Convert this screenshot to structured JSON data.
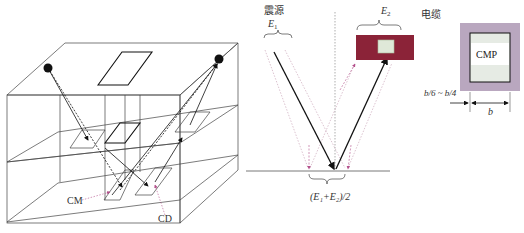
{
  "figure": {
    "panel_3d": {
      "labels": {
        "cm": "CM",
        "cd": "CD"
      }
    },
    "panel_reflection": {
      "source_label": "震源",
      "source_energy": "E",
      "source_energy_sub": "1",
      "receiver_energy": "E",
      "receiver_energy_sub": "2",
      "cable_label": "电缆",
      "midpoint_formula": "(E₁+E₂)/2"
    },
    "panel_cmp": {
      "box_label": "CMP",
      "offset_label": "b/6 ~ b/4",
      "width_label": "b"
    },
    "colors": {
      "cable_box": "#8b2338",
      "cable_inner": "#dfe8d8",
      "cmp_outer": "#b9a7bf",
      "arrow_pink": "#b4508c",
      "line": "#333333"
    }
  }
}
